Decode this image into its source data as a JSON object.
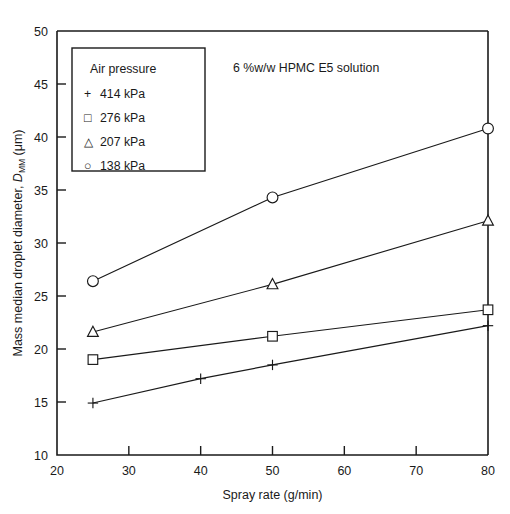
{
  "chart_data": {
    "type": "line",
    "title": "",
    "annotation": "6 %w/w HPMC E5 solution",
    "xlabel": "Spray rate (g/min)",
    "ylabel": "Mass median droplet diameter, D_MM (μm)",
    "ylabel_parts": {
      "pre": "Mass median droplet diameter, ",
      "symbol": "D",
      "subscript": "MM",
      "post": " (μm)"
    },
    "xlim": [
      20,
      80
    ],
    "ylim": [
      10,
      50
    ],
    "xticks": [
      20,
      30,
      40,
      50,
      60,
      70,
      80
    ],
    "yticks": [
      10,
      15,
      20,
      25,
      30,
      35,
      40,
      45,
      50
    ],
    "xticklabels": [
      "20",
      "30",
      "40",
      "50",
      "60",
      "70",
      "80"
    ],
    "yticklabels": [
      "10",
      "15",
      "20",
      "25",
      "30",
      "35",
      "40",
      "45",
      "50"
    ],
    "grid": false,
    "legend_position": "upper-left",
    "legend_title": "Air pressure",
    "series": [
      {
        "name": "414 kPa",
        "marker": "plus",
        "label": "+ 414 kPa",
        "x": [
          25,
          40,
          50,
          80
        ],
        "y": [
          14.9,
          17.2,
          18.5,
          22.2
        ]
      },
      {
        "name": "276 kPa",
        "marker": "square",
        "label": "□ 276 kPa",
        "x": [
          25,
          50,
          80
        ],
        "y": [
          19.0,
          21.2,
          23.7
        ]
      },
      {
        "name": "207 kPa",
        "marker": "triangle",
        "label": "△ 207 kPa",
        "x": [
          25,
          50,
          80
        ],
        "y": [
          21.6,
          26.1,
          32.1
        ]
      },
      {
        "name": "138 kPa",
        "marker": "circle",
        "label": "○ 138 kPa",
        "x": [
          25,
          50,
          80
        ],
        "y": [
          26.4,
          34.3,
          40.8
        ]
      }
    ],
    "colors": {
      "ink": "#1a1a1a",
      "background": "#ffffff"
    }
  },
  "legend": {
    "title": "Air pressure",
    "entries": [
      {
        "symbol": "+",
        "label": "414 kPa"
      },
      {
        "symbol": "□",
        "label": "276 kPa"
      },
      {
        "symbol": "△",
        "label": "207 kPa"
      },
      {
        "symbol": "○",
        "label": "138 kPa"
      }
    ]
  }
}
